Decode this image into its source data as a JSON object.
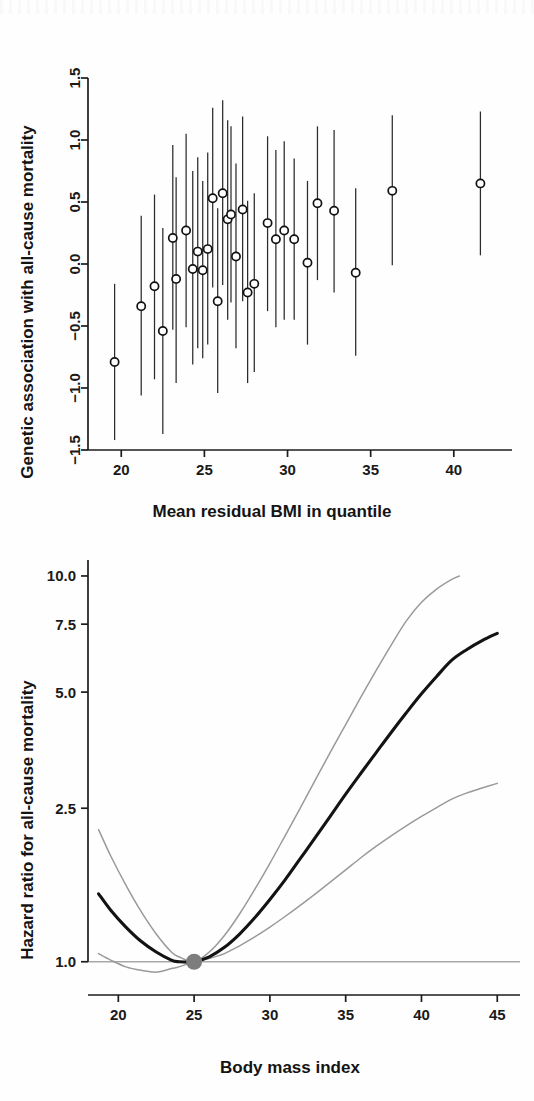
{
  "document": {
    "type": "scientific-figure",
    "panel_count": 2,
    "background_color": "#fefefe",
    "ink_color": "#131313"
  },
  "chart_data": [
    {
      "id": "panel-a-scatter",
      "type": "scatter",
      "title": "",
      "xlabel": "Mean residual BMI in quantile",
      "ylabel": "Genetic association with all-cause mortality",
      "xlim": [
        18.0,
        43.5
      ],
      "ylim": [
        -1.5,
        1.5
      ],
      "xticks": [
        20,
        25,
        30,
        35,
        40
      ],
      "yticks": [
        -1.5,
        -1.0,
        -0.5,
        0.0,
        0.5,
        1.0,
        1.5
      ],
      "xtick_labels": [
        "20",
        "25",
        "30",
        "35",
        "40"
      ],
      "ytick_labels": [
        "-1.5",
        "-1.0",
        "-0.5",
        "0.0",
        "0.5",
        "1.0",
        "1.5"
      ],
      "grid": false,
      "legend": "none",
      "marker_style": "open-circle",
      "error_bars": "vertical 95% confidence intervals",
      "series": [
        {
          "name": "Genetic association per BMI quantile",
          "points": [
            {
              "x": 19.6,
              "y": -0.79,
              "lo": -1.42,
              "hi": -0.16
            },
            {
              "x": 21.2,
              "y": -0.34,
              "lo": -1.06,
              "hi": 0.39
            },
            {
              "x": 22.0,
              "y": -0.18,
              "lo": -0.93,
              "hi": 0.56
            },
            {
              "x": 22.5,
              "y": -0.54,
              "lo": -1.37,
              "hi": 0.29
            },
            {
              "x": 23.1,
              "y": 0.21,
              "lo": -0.53,
              "hi": 0.96
            },
            {
              "x": 23.3,
              "y": -0.12,
              "lo": -0.96,
              "hi": 0.7
            },
            {
              "x": 23.9,
              "y": 0.27,
              "lo": -0.51,
              "hi": 1.05
            },
            {
              "x": 24.3,
              "y": -0.04,
              "lo": -0.81,
              "hi": 0.75
            },
            {
              "x": 24.6,
              "y": 0.1,
              "lo": -0.68,
              "hi": 0.86
            },
            {
              "x": 24.9,
              "y": -0.05,
              "lo": -0.76,
              "hi": 0.67
            },
            {
              "x": 25.2,
              "y": 0.12,
              "lo": -0.65,
              "hi": 0.9
            },
            {
              "x": 25.5,
              "y": 0.53,
              "lo": -0.19,
              "hi": 1.26
            },
            {
              "x": 25.8,
              "y": -0.3,
              "lo": -1.04,
              "hi": 0.45
            },
            {
              "x": 26.1,
              "y": 0.57,
              "lo": -0.17,
              "hi": 1.32
            },
            {
              "x": 26.4,
              "y": 0.36,
              "lo": -0.45,
              "hi": 1.16
            },
            {
              "x": 26.6,
              "y": 0.4,
              "lo": -0.31,
              "hi": 1.11
            },
            {
              "x": 26.9,
              "y": 0.06,
              "lo": -0.68,
              "hi": 0.81
            },
            {
              "x": 27.3,
              "y": 0.44,
              "lo": -0.3,
              "hi": 1.19
            },
            {
              "x": 27.6,
              "y": -0.23,
              "lo": -0.96,
              "hi": 0.51
            },
            {
              "x": 28.0,
              "y": -0.16,
              "lo": -0.87,
              "hi": 0.57
            },
            {
              "x": 28.8,
              "y": 0.33,
              "lo": -0.38,
              "hi": 1.03
            },
            {
              "x": 29.3,
              "y": 0.2,
              "lo": -0.51,
              "hi": 0.92
            },
            {
              "x": 29.8,
              "y": 0.27,
              "lo": -0.45,
              "hi": 0.99
            },
            {
              "x": 30.4,
              "y": 0.2,
              "lo": -0.45,
              "hi": 0.85
            },
            {
              "x": 31.2,
              "y": 0.01,
              "lo": -0.65,
              "hi": 0.67
            },
            {
              "x": 31.8,
              "y": 0.49,
              "lo": -0.13,
              "hi": 1.11
            },
            {
              "x": 32.8,
              "y": 0.43,
              "lo": -0.23,
              "hi": 1.08
            },
            {
              "x": 34.1,
              "y": -0.07,
              "lo": -0.74,
              "hi": 0.61
            },
            {
              "x": 36.3,
              "y": 0.59,
              "lo": -0.01,
              "hi": 1.2
            },
            {
              "x": 41.6,
              "y": 0.65,
              "lo": 0.07,
              "hi": 1.23
            }
          ]
        }
      ]
    },
    {
      "id": "panel-b-curve",
      "type": "line",
      "title": "",
      "xlabel": "Body mass index",
      "ylabel": "Hazard ratio for all-cause mortality",
      "xlim": [
        18.0,
        46.5
      ],
      "ylim": [
        0.82,
        11.0
      ],
      "yscale": "log",
      "xticks": [
        20,
        25,
        30,
        35,
        40,
        45
      ],
      "yticks": [
        1.0,
        2.5,
        5.0,
        7.5,
        10.0
      ],
      "xtick_labels": [
        "20",
        "25",
        "30",
        "35",
        "40",
        "45"
      ],
      "ytick_labels": [
        "1.0",
        "2.5",
        "5.0",
        "7.5",
        "10.0"
      ],
      "grid": false,
      "legend": "none",
      "reference": {
        "line_value": 1.0,
        "point_x": 25.0,
        "point_y": 1.0,
        "color": "#7d7d7d",
        "label": "referent BMI 25"
      },
      "series": [
        {
          "name": "Hazard ratio (point estimate)",
          "color": "#131313",
          "x": [
            18.7,
            19.5,
            20.5,
            21.5,
            22.5,
            23.5,
            24.0,
            25.0,
            26.0,
            27.0,
            28.0,
            29.0,
            30.0,
            31.0,
            32.0,
            33.0,
            34.0,
            35.0,
            36.0,
            37.0,
            38.0,
            39.0,
            40.0,
            41.0,
            42.0,
            43.0,
            44.0,
            45.0
          ],
          "y": [
            1.5,
            1.36,
            1.23,
            1.13,
            1.06,
            1.01,
            1.0,
            1.0,
            1.03,
            1.09,
            1.18,
            1.3,
            1.45,
            1.63,
            1.85,
            2.1,
            2.39,
            2.72,
            3.08,
            3.48,
            3.93,
            4.42,
            4.95,
            5.49,
            6.05,
            6.45,
            6.8,
            7.1
          ]
        },
        {
          "name": "Upper 95% confidence limit",
          "color": "#9a9a9a",
          "x": [
            18.7,
            19.5,
            20.5,
            21.5,
            22.5,
            23.5,
            24.0,
            25.0,
            26.0,
            27.0,
            28.0,
            29.0,
            30.0,
            31.0,
            32.0,
            33.0,
            34.0,
            35.0,
            36.0,
            37.0,
            38.0,
            39.0,
            40.0,
            41.0,
            42.0,
            42.5
          ],
          "y": [
            2.2,
            1.88,
            1.58,
            1.35,
            1.18,
            1.06,
            1.03,
            1.0,
            1.06,
            1.17,
            1.33,
            1.54,
            1.8,
            2.12,
            2.5,
            2.96,
            3.5,
            4.12,
            4.85,
            5.68,
            6.62,
            7.65,
            8.55,
            9.25,
            9.8,
            10.0
          ]
        },
        {
          "name": "Lower 95% confidence limit",
          "color": "#9a9a9a",
          "x": [
            18.7,
            19.5,
            20.5,
            21.5,
            22.5,
            23.5,
            24.0,
            25.0,
            26.0,
            27.0,
            28.0,
            29.0,
            30.0,
            31.0,
            32.0,
            33.0,
            34.0,
            35.0,
            36.0,
            37.0,
            38.0,
            39.0,
            40.0,
            41.0,
            42.0,
            43.0,
            44.0,
            45.0
          ],
          "y": [
            1.05,
            1.01,
            0.97,
            0.95,
            0.94,
            0.96,
            0.97,
            1.0,
            1.02,
            1.05,
            1.1,
            1.16,
            1.23,
            1.31,
            1.4,
            1.5,
            1.61,
            1.73,
            1.86,
            1.99,
            2.12,
            2.25,
            2.38,
            2.51,
            2.64,
            2.74,
            2.82,
            2.9
          ]
        }
      ]
    }
  ]
}
